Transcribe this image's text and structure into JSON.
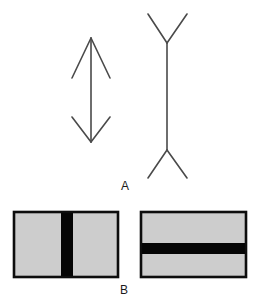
{
  "figure": {
    "width": 258,
    "height": 303,
    "background_color": "#ffffff",
    "line_color": "#4a4a4a",
    "outline_color": "#0d0d0d",
    "fill_gray": "#cdcdcd",
    "bar_black": "#050505",
    "label_color": "#1a1a1a"
  },
  "panels": [
    {
      "id": "A",
      "label": "A",
      "label_position": {
        "x": 125,
        "y": 187
      },
      "description": "Muller-Lyer illusion: two vertical shafts of different fin orientation",
      "figures": [
        {
          "name": "arrow-outward-fins",
          "side": "left",
          "shaft": {
            "x": 91,
            "y_top": 38,
            "y_bottom": 142,
            "length": 104
          },
          "fin_style": "arrowheads-pointing-outward",
          "fin_half_width": 19,
          "fin_depth": 40,
          "stroke_width": 1.6
        },
        {
          "name": "arrow-inward-fins",
          "side": "right",
          "shaft": {
            "x": 167,
            "y_top": 43,
            "y_bottom": 150,
            "length": 107
          },
          "fin_style": "fins-flaring-outward-Y",
          "fin_half_width": 21,
          "fin_depth": 30,
          "stroke_width": 1.6
        }
      ]
    },
    {
      "id": "B",
      "label": "B",
      "label_position": {
        "x": 124,
        "y": 291
      },
      "description": "Two gray rectangles with an off-center black bar, one vertical one horizontal",
      "figures": [
        {
          "name": "rect-vertical-bar",
          "side": "left",
          "rect": {
            "x": 14,
            "y": 212,
            "width": 104,
            "height": 65
          },
          "bar_orientation": "vertical",
          "bar": {
            "x": 61,
            "y": 212,
            "width": 12,
            "height": 65
          }
        },
        {
          "name": "rect-horizontal-bar",
          "side": "right",
          "rect": {
            "x": 141,
            "y": 212,
            "width": 105,
            "height": 65
          },
          "bar_orientation": "horizontal",
          "bar": {
            "x": 141,
            "y": 243,
            "width": 105,
            "height": 11
          }
        }
      ]
    }
  ]
}
